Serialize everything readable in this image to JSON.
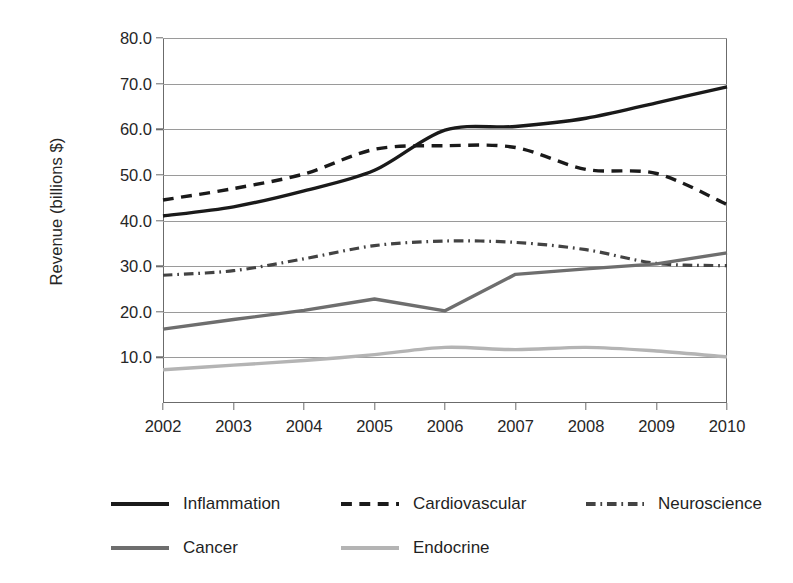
{
  "chart_data": {
    "type": "line",
    "title": "",
    "xlabel": "",
    "ylabel": "Revenue (billions $)",
    "x": [
      2002,
      2003,
      2004,
      2005,
      2006,
      2007,
      2008,
      2009,
      2010
    ],
    "categories": [
      "2002",
      "2003",
      "2004",
      "2005",
      "2006",
      "2007",
      "2008",
      "2009",
      "2010"
    ],
    "xlim": [
      2002,
      2010
    ],
    "ylim": [
      0,
      80
    ],
    "yticks": [
      10,
      20,
      30,
      40,
      50,
      60,
      70,
      80
    ],
    "ytick_labels": [
      "10.0",
      "20.0",
      "30.0",
      "40.0",
      "50.0",
      "60.0",
      "70.0",
      "80.0"
    ],
    "grid": "horizontal",
    "legend_position": "bottom",
    "series": [
      {
        "name": "Inflammation",
        "color": "#1a1a1a",
        "style": "solid",
        "width": 3.4,
        "values": [
          41.0,
          43.0,
          46.5,
          51.0,
          59.8,
          60.6,
          62.4,
          65.8,
          69.3
        ]
      },
      {
        "name": "Cardiovascular",
        "color": "#1a1a1a",
        "style": "dashed",
        "width": 3.4,
        "values": [
          44.5,
          47.0,
          50.2,
          55.6,
          56.4,
          56.0,
          51.2,
          50.3,
          43.5
        ]
      },
      {
        "name": "Neuroscience",
        "color": "#434343",
        "style": "dash-dot",
        "width": 3.2,
        "values": [
          28.0,
          29.0,
          31.6,
          34.5,
          35.5,
          35.2,
          33.6,
          30.6,
          30.1
        ]
      },
      {
        "name": "Cancer",
        "color": "#6e6e6e",
        "style": "solid",
        "width": 3.4,
        "values": [
          16.2,
          18.3,
          20.3,
          22.8,
          20.2,
          28.2,
          29.4,
          30.5,
          32.9
        ]
      },
      {
        "name": "Endocrine",
        "color": "#b4b4b4",
        "style": "solid",
        "width": 3.4,
        "values": [
          7.3,
          8.3,
          9.3,
          10.6,
          12.2,
          11.7,
          12.2,
          11.4,
          10.1
        ]
      }
    ]
  },
  "legend": {
    "rows": [
      [
        "Inflammation",
        "Cardiovascular",
        "Neuroscience"
      ],
      [
        "Cancer",
        "Endocrine"
      ]
    ]
  }
}
